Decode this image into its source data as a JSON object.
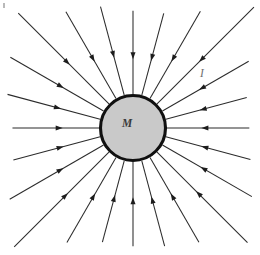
{
  "figure": {
    "name": "radial-inward-field-diagram",
    "caption_labels": {
      "central_body": "M",
      "field": "I"
    },
    "canvas": {
      "width": 260,
      "height": 255,
      "background": "#ffffff"
    },
    "central_body": {
      "name": "central-mass-circle",
      "center_x": 133,
      "center_y": 128,
      "radius": 32.5,
      "fill_color": "#c9c9c9",
      "stroke_color": "#101010",
      "stroke_width": 3.1,
      "label": "M",
      "label_x": 127,
      "label_y": 127
    },
    "field_label": {
      "name": "field-label-I",
      "text": "I",
      "x": 202,
      "y": 77,
      "color": "#6e6e6e"
    },
    "rays": {
      "count": 24,
      "angle_step_degrees": 15,
      "start_radius": 34,
      "direction": "inward",
      "arrow_position_fraction": 0.46,
      "line_color": "#2b2b2b",
      "arrow_color": "#1c1c1c",
      "line_width": 1.05,
      "outer_extent_description": "rays terminate near the canvas edge, clipped by the frame",
      "angles_degrees": [
        0,
        15,
        30,
        45,
        60,
        75,
        90,
        105,
        120,
        135,
        150,
        165,
        180,
        195,
        210,
        225,
        240,
        255,
        270,
        285,
        300,
        315,
        330,
        345
      ]
    },
    "corner_speck": {
      "name": "scan-artifact-speck",
      "x": 3,
      "y": 3,
      "width": 2,
      "height": 5,
      "color": "#b9b9b9"
    }
  },
  "chart_data": {
    "type": "diagram",
    "title": "",
    "elements": [
      {
        "kind": "circle",
        "label": "M",
        "cx": 133,
        "cy": 128,
        "r": 32.5
      },
      {
        "kind": "radial-rays",
        "label": "I",
        "count": 24,
        "direction": "inward"
      }
    ]
  }
}
